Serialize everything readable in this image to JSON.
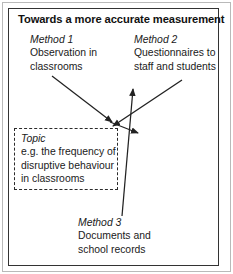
{
  "figure": {
    "title": "Towards a more accurate measurement",
    "frame_color": "#333333",
    "outer_rule_color": "#b9b9b9",
    "background": "#ffffff",
    "arrow_color": "#222222"
  },
  "topic": {
    "head": "Topic",
    "line1": "e.g. the frequency of",
    "line2": "disruptive behaviour",
    "line3": "in classrooms",
    "border_style": "dashed"
  },
  "methods": [
    {
      "head": "Method 1",
      "line1": "Observation in",
      "line2": "classrooms"
    },
    {
      "head": "Method 2",
      "line1": "Questionnaires to",
      "line2": "staff and students"
    },
    {
      "head": "Method 3",
      "line1": "Documents and",
      "line2": "school records"
    }
  ],
  "arrows": [
    {
      "name": "method-1-to-topic",
      "from": [
        52,
        76
      ],
      "to": [
        112,
        122
      ]
    },
    {
      "name": "method-2-to-topic",
      "from": [
        182,
        80
      ],
      "to": [
        113,
        126
      ]
    },
    {
      "name": "method-3-to-topic",
      "from": [
        122,
        216
      ],
      "to": [
        133,
        89
      ]
    },
    {
      "name": "topic-branch",
      "from": [
        110,
        122
      ],
      "to": [
        138,
        133
      ]
    }
  ]
}
